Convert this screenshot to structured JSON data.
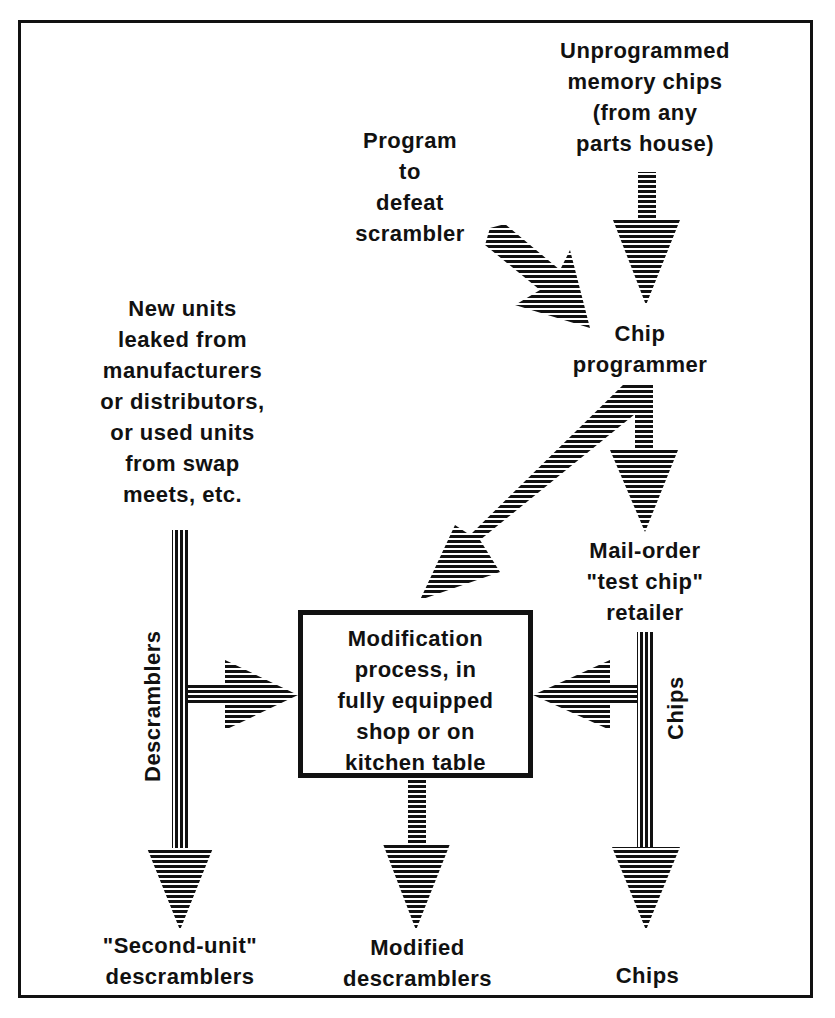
{
  "diagram": {
    "type": "flowchart",
    "nodes": {
      "unprogrammed_chips": "Unprogrammed\nmemory chips\n(from any\nparts house)",
      "program": "Program\nto\ndefeat\nscrambler",
      "chip_programmer": "Chip\nprogrammer",
      "new_units": "New units\nleaked from\nmanufacturers\nor distributors,\nor used units\nfrom swap\nmeets, etc.",
      "mail_order": "Mail-order\n\"test chip\"\nretailer",
      "modification": "Modification\nprocess, in\nfully equipped\nshop or on\nkitchen table",
      "second_unit": "\"Second-unit\"\ndescramblers",
      "modified": "Modified\ndescramblers",
      "chips_out": "Chips"
    },
    "edge_labels": {
      "descramblers": "Descramblers",
      "chips": "Chips"
    },
    "edges": [
      {
        "from": "Unprogrammed memory chips",
        "to": "Chip programmer"
      },
      {
        "from": "Program to defeat scrambler",
        "to": "Chip programmer"
      },
      {
        "from": "Chip programmer",
        "to": "Modification process"
      },
      {
        "from": "Chip programmer",
        "to": "Mail-order \"test chip\" retailer"
      },
      {
        "from": "New units",
        "to": "Modification process",
        "label": "Descramblers"
      },
      {
        "from": "New units",
        "to": "\"Second-unit\" descramblers"
      },
      {
        "from": "Mail-order \"test chip\" retailer",
        "to": "Modification process",
        "label": "Chips"
      },
      {
        "from": "Mail-order \"test chip\" retailer",
        "to": "Chips"
      },
      {
        "from": "Modification process",
        "to": "Modified descramblers"
      }
    ],
    "colors": {
      "ink": "#111111",
      "paper": "#ffffff"
    }
  }
}
